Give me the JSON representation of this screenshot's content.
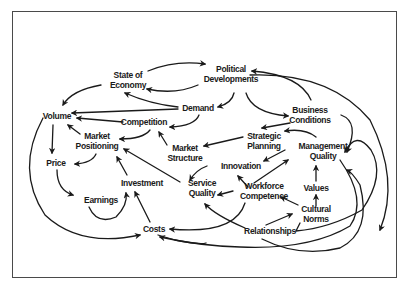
{
  "diagram": {
    "type": "causal-loop",
    "nodes": [
      {
        "id": "state_of_economy",
        "lines": [
          "State of",
          "Economy"
        ],
        "x": 128,
        "y": 80
      },
      {
        "id": "political_developments",
        "lines": [
          "Political",
          "Developments"
        ],
        "x": 231,
        "y": 74
      },
      {
        "id": "demand",
        "lines": [
          "Demand"
        ],
        "x": 198,
        "y": 108
      },
      {
        "id": "business_conditions",
        "lines": [
          "Business",
          "Conditions"
        ],
        "x": 310,
        "y": 115
      },
      {
        "id": "volume",
        "lines": [
          "Volume"
        ],
        "x": 57,
        "y": 116
      },
      {
        "id": "competition",
        "lines": [
          "Competition"
        ],
        "x": 144,
        "y": 122
      },
      {
        "id": "market_positioning",
        "lines": [
          "Market",
          "Positioning"
        ],
        "x": 97,
        "y": 141
      },
      {
        "id": "strategic_planning",
        "lines": [
          "Strategic",
          "Planning"
        ],
        "x": 264,
        "y": 141
      },
      {
        "id": "management_quality",
        "lines": [
          "Management",
          "Quality"
        ],
        "x": 323,
        "y": 151
      },
      {
        "id": "market_structure",
        "lines": [
          "Market",
          "Structure"
        ],
        "x": 185,
        "y": 153
      },
      {
        "id": "innovation",
        "lines": [
          "Innovation"
        ],
        "x": 241,
        "y": 166
      },
      {
        "id": "price",
        "lines": [
          "Price"
        ],
        "x": 56,
        "y": 163
      },
      {
        "id": "investment",
        "lines": [
          "Investment"
        ],
        "x": 142,
        "y": 183
      },
      {
        "id": "values",
        "lines": [
          "Values"
        ],
        "x": 316,
        "y": 188
      },
      {
        "id": "service_quality",
        "lines": [
          "Service",
          "Quality"
        ],
        "x": 202,
        "y": 188
      },
      {
        "id": "workforce_competence",
        "lines": [
          "Workforce",
          "Competence"
        ],
        "x": 264,
        "y": 191
      },
      {
        "id": "earnings",
        "lines": [
          "Earnings"
        ],
        "x": 101,
        "y": 200
      },
      {
        "id": "cultural_norms",
        "lines": [
          "Cultural",
          "Norms"
        ],
        "x": 316,
        "y": 214
      },
      {
        "id": "costs",
        "lines": [
          "Costs"
        ],
        "x": 154,
        "y": 229
      },
      {
        "id": "relationships",
        "lines": [
          "Relationships"
        ],
        "x": 270,
        "y": 231
      }
    ],
    "edges": [
      {
        "from": "state_of_economy",
        "to": "political_developments",
        "d": "M148,71 Q175,60 205,64"
      },
      {
        "from": "political_developments",
        "to": "state_of_economy",
        "d": "M198,85 Q175,95 147,89"
      },
      {
        "from": "state_of_economy",
        "to": "volume",
        "d": "M101,85 Q72,90 63,105"
      },
      {
        "from": "demand",
        "to": "state_of_economy",
        "d": "M178,107 Q150,104 125,93"
      },
      {
        "from": "demand",
        "to": "volume",
        "d": "M178,109 L72,113"
      },
      {
        "from": "political_developments",
        "to": "demand",
        "d": "M234,93 Q232,103 218,107"
      },
      {
        "from": "political_developments",
        "to": "business_conditions",
        "d": "M246,93 Q252,113 288,116"
      },
      {
        "from": "business_conditions",
        "to": "political_developments",
        "d": "M311,100 Q300,75 252,71"
      },
      {
        "from": "demand",
        "to": "competition",
        "d": "M199,115 Q195,126 170,127"
      },
      {
        "from": "competition",
        "to": "volume",
        "d": "M123,122 L77,118"
      },
      {
        "from": "competition",
        "to": "market_positioning",
        "d": "M150,130 Q143,139 120,139"
      },
      {
        "from": "market_positioning",
        "to": "volume",
        "d": "M80,134 L68,125"
      },
      {
        "from": "market_structure",
        "to": "competition",
        "d": "M167,145 L159,132"
      },
      {
        "from": "business_conditions",
        "to": "strategic_planning",
        "d": "M290,123 L262,128"
      },
      {
        "from": "strategic_planning",
        "to": "market_structure",
        "d": "M243,137 L204,146"
      },
      {
        "from": "management_quality",
        "to": "strategic_planning",
        "d": "M316,137 Q305,128 285,131"
      },
      {
        "from": "business_conditions",
        "to": "management_quality",
        "d": "M341,115 Q360,122 347,152"
      },
      {
        "from": "volume",
        "to": "price",
        "d": "M53,125 L52,153"
      },
      {
        "from": "market_positioning",
        "to": "price",
        "d": "M96,154 Q92,163 75,164"
      },
      {
        "from": "price",
        "to": "earnings",
        "d": "M57,170 Q57,190 73,195"
      },
      {
        "from": "earnings",
        "to": "investment",
        "d": "M89,207 Q97,225 116,217 Q128,205 126,193"
      },
      {
        "from": "investment",
        "to": "market_positioning",
        "d": "M127,175 L117,157"
      },
      {
        "from": "costs",
        "to": "investment",
        "d": "M150,222 L135,192"
      },
      {
        "from": "service_quality",
        "to": "market_positioning",
        "d": "M180,182 L124,149"
      },
      {
        "from": "market_structure",
        "to": "service_quality",
        "d": "M207,166 Q196,170 190,180"
      },
      {
        "from": "strategic_planning",
        "to": "innovation",
        "d": "M285,150 L264,161"
      },
      {
        "from": "workforce_competence",
        "to": "innovation",
        "d": "M248,187 L238,176"
      },
      {
        "from": "workforce_competence",
        "to": "strategic_planning",
        "d": "M254,183 L288,160"
      },
      {
        "from": "workforce_competence",
        "to": "service_quality",
        "d": "M233,191 L218,195"
      },
      {
        "from": "cultural_norms",
        "to": "workforce_competence",
        "d": "M298,205 L281,197"
      },
      {
        "from": "cultural_norms",
        "to": "values",
        "d": "M316,206 L316,195"
      },
      {
        "from": "values",
        "to": "management_quality",
        "d": "M316,181 L316,166"
      },
      {
        "from": "relationships",
        "to": "cultural_norms",
        "d": "M266,225 L292,214"
      },
      {
        "from": "cultural_norms",
        "to": "relationships",
        "d": "M300,223 L296,231 Q330,228 362,210 Q386,175 371,150 Q356,130 345,152"
      },
      {
        "from": "workforce_competence",
        "to": "costs",
        "d": "M245,203 Q235,235 170,229"
      },
      {
        "from": "relationships",
        "to": "service_quality",
        "d": "M245,228 Q215,215 205,204"
      },
      {
        "from": "relationships",
        "to": "costs",
        "d": "M206,243 Q200,245 175,240 Q168,238 158,235 M262,239 Q300,258 340,248 Q372,232 360,185 Q352,172 347,170"
      },
      {
        "from": "management_quality",
        "to": "costs",
        "d": "M340,160 Q368,200 350,226 Q310,250 240,247 Q200,246 160,237"
      },
      {
        "from": "business_conditions_outer",
        "to": "political_developments",
        "d": "M250,75 Q330,72 370,120 Q400,180 380,230"
      },
      {
        "from": "volume_outer",
        "to": "costs",
        "d": "M43,118 Q15,170 45,215 Q80,248 140,235"
      }
    ]
  },
  "caption": {
    "text": ""
  },
  "colors": {
    "ink": "#1a1a1a",
    "frame": "#4a4a4a",
    "background": "#ffffff"
  }
}
